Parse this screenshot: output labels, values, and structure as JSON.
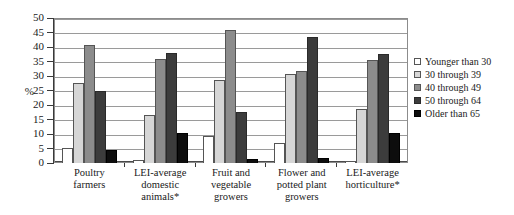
{
  "chart_data": {
    "type": "bar",
    "title": "",
    "subtitle": "",
    "xlabel": "",
    "ylabel": "%",
    "ylim": [
      0,
      50
    ],
    "ytick_step": 5,
    "yticks": [
      0,
      5,
      10,
      15,
      20,
      25,
      30,
      35,
      40,
      45,
      50
    ],
    "grid": true,
    "grid_axis": "y",
    "legend_position": "right",
    "categories": [
      "Poultry farmers",
      "LEI-average domestic animals*",
      "Fruit and vegetable growers",
      "Flower and potted plant growers",
      "LEI-average horticulture*"
    ],
    "category_lines": [
      [
        "Poultry",
        "farmers"
      ],
      [
        "LEI-average",
        "domestic",
        "animals*"
      ],
      [
        "Fruit and",
        "vegetable",
        "growers"
      ],
      [
        "Flower and",
        "potted plant",
        "growers"
      ],
      [
        "LEI-average",
        "horticulture*"
      ]
    ],
    "series": [
      {
        "name": "Younger than 30",
        "color": "#ffffff",
        "values": [
          5.3,
          1.0,
          9.4,
          7.0,
          0.8
        ]
      },
      {
        "name": "30 through 39",
        "color": "#d6d6d6",
        "values": [
          27.5,
          16.7,
          28.5,
          30.8,
          18.5
        ]
      },
      {
        "name": "40 through 49",
        "color": "#8c8c8c",
        "values": [
          40.7,
          35.8,
          46.0,
          31.8,
          35.5
        ]
      },
      {
        "name": "50 through 64",
        "color": "#3c3c3c",
        "values": [
          24.8,
          37.8,
          17.5,
          43.5,
          37.5
        ]
      },
      {
        "name": "Older than 65",
        "color": "#0d0d0d",
        "values": [
          4.5,
          10.5,
          1.3,
          1.8,
          10.5
        ]
      }
    ]
  },
  "legend": {
    "items": [
      {
        "label": "Younger than 30"
      },
      {
        "label": "30 through 39"
      },
      {
        "label": "40 through 49"
      },
      {
        "label": "50 through 64"
      },
      {
        "label": "Older than 65"
      }
    ]
  },
  "axis": {
    "y_title": "%"
  }
}
